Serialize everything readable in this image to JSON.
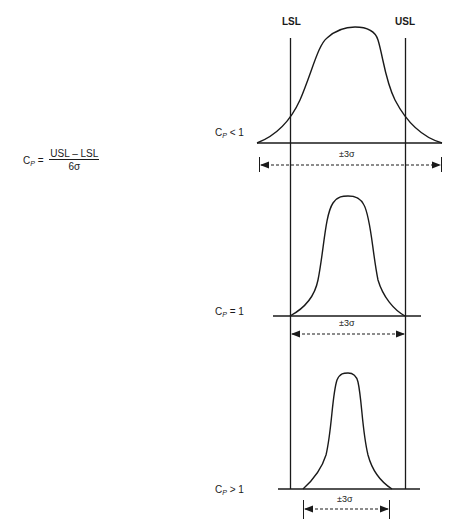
{
  "formula": {
    "lhs_main": "C",
    "lhs_sub": "P",
    "equals": "=",
    "numerator": "USL – LSL",
    "denominator": "6σ"
  },
  "limits": {
    "lower": "LSL",
    "upper": "USL"
  },
  "panels": [
    {
      "label_main": "C",
      "label_sub": "P",
      "label_rel": "< 1",
      "spread": "±3σ"
    },
    {
      "label_main": "C",
      "label_sub": "P",
      "label_rel": "= 1",
      "spread": "±3σ"
    },
    {
      "label_main": "C",
      "label_sub": "P",
      "label_rel": "> 1",
      "spread": "±3σ"
    }
  ],
  "colors": {
    "line": "#1a1a1a",
    "background": "#ffffff"
  }
}
